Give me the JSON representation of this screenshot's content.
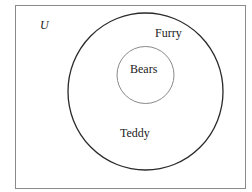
{
  "diagram": {
    "type": "venn",
    "universe": {
      "label": "U"
    },
    "sets": [
      {
        "name": "Furry",
        "label": "Furry"
      },
      {
        "name": "Bears",
        "label": "Bears"
      }
    ],
    "region_labels": {
      "outer_circle_inner_note": "Teddy"
    },
    "colors": {
      "border": "#8a8a8a",
      "outer_circle": "#2a2a2a",
      "inner_circle": "#8a8a8a",
      "text": "#222222"
    }
  }
}
